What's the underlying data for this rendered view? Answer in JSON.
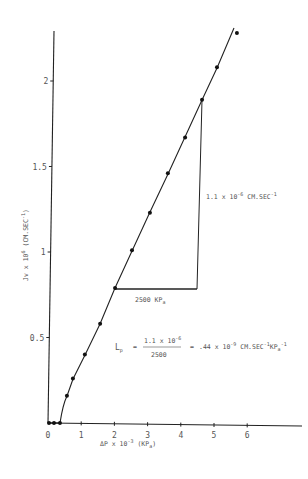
{
  "chart_data": {
    "type": "scatter",
    "title": "",
    "xlabel": "ΔP x 10⁻³ (KPa)",
    "ylabel": "Jv x 10⁶ (CM.SEC⁻¹)",
    "xlim": [
      0,
      7.6
    ],
    "ylim": [
      0,
      2.3
    ],
    "grid": false,
    "legend": null,
    "x_ticks": [
      "0",
      "1",
      "2",
      "3",
      "4",
      "5",
      "6"
    ],
    "y_ticks": [
      "0.5",
      "1",
      "1.5",
      "2"
    ],
    "series": [
      {
        "name": "Jv vs ΔP",
        "x": [
          0.03,
          0.18,
          0.36,
          0.57,
          0.75,
          1.11,
          1.57,
          2.02,
          2.53,
          3.07,
          3.61,
          4.13,
          4.64,
          5.09,
          5.69
        ],
        "y": [
          0,
          0,
          0,
          0.16,
          0.26,
          0.4,
          0.58,
          0.79,
          1.01,
          1.23,
          1.46,
          1.67,
          1.89,
          2.08,
          2.28
        ]
      }
    ],
    "slope_triangle": {
      "horizontal_label": "2500 KPa",
      "vertical_label": "1.1 x 10⁻⁶ CM.SEC⁻¹"
    },
    "annotations": [
      "Lp = (1.1 x 10⁻⁶) / 2500 = .44 x 10⁻⁹ CM.SEC⁻¹KPa⁻¹"
    ]
  },
  "labels": {
    "y_axis": {
      "main": "Jv x 10",
      "exp": "6",
      "unit": "(CM.SEC",
      "unit_exp": "-1",
      "close": ")"
    },
    "x_axis": {
      "main": "ΔP x 10",
      "exp": "-3",
      "unit": "(KP",
      "unit_sub": "a",
      "close": ")"
    },
    "ticks_x": [
      "0",
      "1",
      "2",
      "3",
      "4",
      "5",
      "6"
    ],
    "ticks_y": [
      "0.5",
      "1",
      "1.5",
      "2"
    ],
    "triangle_h": {
      "value": "2500 KP",
      "sub": "a"
    },
    "triangle_v": {
      "main": "1.1 x 10",
      "exp": "-6",
      "unit": " CM.SEC",
      "unit_exp": "-1"
    },
    "formula": {
      "lhs": "L",
      "lhs_sub": "p",
      "eq": "=",
      "num_main": "1.1 x 10",
      "num_exp": "-6",
      "den": "2500",
      "eq2": "=",
      "rhs_main": ".44 x 10",
      "rhs_exp": "-9",
      "rhs_unit": " CM.SEC",
      "rhs_unit_exp": "-1",
      "rhs_unit2": "KP",
      "rhs_unit2_sub": "a",
      "rhs_unit2_exp": "-1"
    }
  }
}
